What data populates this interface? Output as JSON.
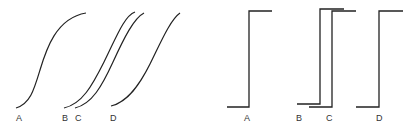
{
  "left_panel": {
    "description": "Sigmoidal curves",
    "curves": [
      {
        "label": "A",
        "path": "M16 108 C 30 104, 34 90, 40 70 S 56 18, 86 13"
      },
      {
        "label": "B",
        "path": "M64 108 C 82 104, 92 86, 104 62 S 124 16, 135 12"
      },
      {
        "label": "C",
        "path": "M75 108 C 92 104, 102 86, 113 62 S 134 18, 144 13"
      },
      {
        "label": "D",
        "path": "M111 106 C 128 102, 140 84, 150 64 S 170 20, 180 13"
      }
    ],
    "labels": [
      {
        "text": "A",
        "x": 16,
        "y": 121
      },
      {
        "text": "B",
        "x": 62,
        "y": 121
      },
      {
        "text": "C",
        "x": 75,
        "y": 121
      },
      {
        "text": "D",
        "x": 110,
        "y": 121
      }
    ]
  },
  "right_panel": {
    "description": "Step functions",
    "steps": [
      {
        "label": "A",
        "path": "M227 107 L249 107 L249 11 L272 11"
      },
      {
        "label": "B",
        "path": "M297 104 L320 104 L320 9 L344 9"
      },
      {
        "label": "C",
        "path": "M309 107 L332 107 L332 11 L356 11"
      },
      {
        "label": "D",
        "path": "M356 107 L379 107 L379 11 L403 11"
      }
    ],
    "labels": [
      {
        "text": "A",
        "x": 244,
        "y": 121
      },
      {
        "text": "B",
        "x": 296,
        "y": 121
      },
      {
        "text": "C",
        "x": 326,
        "y": 121
      },
      {
        "text": "D",
        "x": 376,
        "y": 121
      }
    ]
  }
}
